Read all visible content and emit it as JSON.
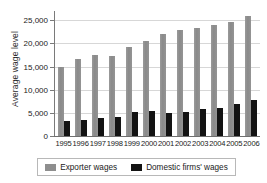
{
  "chart_data": {
    "type": "bar",
    "title": "",
    "xlabel": "",
    "ylabel": "Average wage level",
    "ylim": [
      0,
      27000
    ],
    "yticks": [
      0,
      5000,
      10000,
      15000,
      20000,
      25000
    ],
    "ytick_labels": [
      "0",
      "5,000",
      "10,000",
      "15,000",
      "20,000",
      "25,000"
    ],
    "grid": true,
    "legend_position": "bottom",
    "categories": [
      "1995",
      "1996",
      "1997",
      "1998",
      "1999",
      "2000",
      "2001",
      "2002",
      "2003",
      "2004",
      "2005",
      "2006"
    ],
    "series": [
      {
        "name": "Exporter wages",
        "color": "#8e8e8e",
        "values": [
          14900,
          16600,
          17400,
          17200,
          19200,
          20500,
          22000,
          23000,
          23300,
          23900,
          24600,
          26000
        ]
      },
      {
        "name": "Domestic firms' wages",
        "color": "#131313",
        "values": [
          3200,
          3400,
          3900,
          4100,
          5100,
          5300,
          5000,
          5200,
          5800,
          6000,
          7000,
          7800
        ]
      }
    ]
  },
  "legend": {
    "items": [
      {
        "label": "Exporter wages",
        "swatch": "exporter"
      },
      {
        "label": "Domestic firms' wages",
        "swatch": "domestic"
      }
    ]
  }
}
